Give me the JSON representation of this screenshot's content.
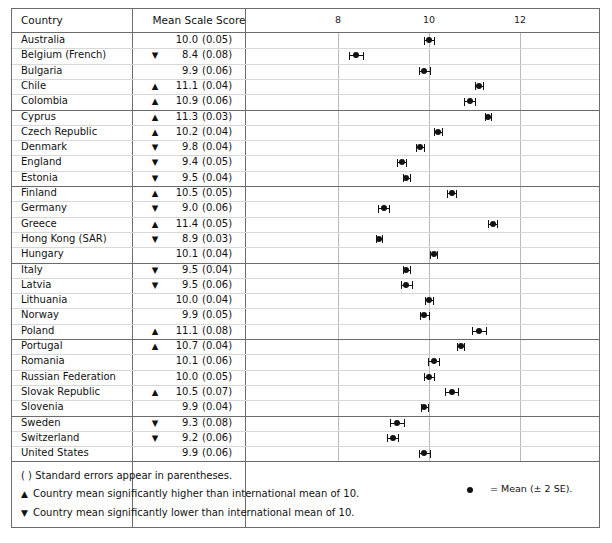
{
  "table": {
    "header": {
      "country_label": "Country",
      "score_label": "Mean Scale Score"
    }
  },
  "chart_data": {
    "type": "scatter",
    "title": "",
    "xlabel": "",
    "ylabel": "Country",
    "xlim": [
      6.9,
      13.2
    ],
    "ticks": [
      8,
      10,
      12
    ],
    "tick_labels": [
      "8",
      "10",
      "12"
    ],
    "grid": true,
    "error_bars": "±2 SE",
    "international_mean": 10,
    "categories": [
      "Australia",
      "Belgium (French)",
      "Bulgaria",
      "Chile",
      "Colombia",
      "Cyprus",
      "Czech Republic",
      "Denmark",
      "England",
      "Estonia",
      "Finland",
      "Germany",
      "Greece",
      "Hong Kong (SAR)",
      "Hungary",
      "Italy",
      "Latvia",
      "Lithuania",
      "Norway",
      "Poland",
      "Portugal",
      "Romania",
      "Russian Federation",
      "Slovak Republic",
      "Slovenia",
      "Sweden",
      "Switzerland",
      "United States"
    ],
    "values": [
      10.0,
      8.4,
      9.9,
      11.1,
      10.9,
      11.3,
      10.2,
      9.8,
      9.4,
      9.5,
      10.5,
      9.0,
      11.4,
      8.9,
      10.1,
      9.5,
      9.5,
      10.0,
      9.9,
      11.1,
      10.7,
      10.1,
      10.0,
      10.5,
      9.9,
      9.3,
      9.2,
      9.9
    ],
    "standard_errors": [
      0.05,
      0.08,
      0.06,
      0.04,
      0.06,
      0.03,
      0.04,
      0.04,
      0.05,
      0.04,
      0.05,
      0.06,
      0.05,
      0.03,
      0.04,
      0.04,
      0.06,
      0.04,
      0.05,
      0.08,
      0.04,
      0.06,
      0.05,
      0.07,
      0.04,
      0.08,
      0.06,
      0.06
    ],
    "significance": [
      "",
      "lower",
      "",
      "higher",
      "higher",
      "higher",
      "higher",
      "lower",
      "lower",
      "lower",
      "higher",
      "lower",
      "higher",
      "lower",
      "",
      "lower",
      "lower",
      "",
      "",
      "higher",
      "higher",
      "",
      "",
      "higher",
      "",
      "lower",
      "lower",
      ""
    ],
    "group_breaks": [
      5,
      10,
      15,
      20,
      25
    ]
  },
  "rows": [
    {
      "country": "Australia",
      "tri": "",
      "mean": "10.0",
      "se": "(0.05)"
    },
    {
      "country": "Belgium (French)",
      "tri": "▼",
      "mean": "8.4",
      "se": "(0.08)"
    },
    {
      "country": "Bulgaria",
      "tri": "",
      "mean": "9.9",
      "se": "(0.06)"
    },
    {
      "country": "Chile",
      "tri": "▲",
      "mean": "11.1",
      "se": "(0.04)"
    },
    {
      "country": "Colombia",
      "tri": "▲",
      "mean": "10.9",
      "se": "(0.06)"
    },
    {
      "country": "Cyprus",
      "tri": "▲",
      "mean": "11.3",
      "se": "(0.03)"
    },
    {
      "country": "Czech Republic",
      "tri": "▲",
      "mean": "10.2",
      "se": "(0.04)"
    },
    {
      "country": "Denmark",
      "tri": "▼",
      "mean": "9.8",
      "se": "(0.04)"
    },
    {
      "country": "England",
      "tri": "▼",
      "mean": "9.4",
      "se": "(0.05)"
    },
    {
      "country": "Estonia",
      "tri": "▼",
      "mean": "9.5",
      "se": "(0.04)"
    },
    {
      "country": "Finland",
      "tri": "▲",
      "mean": "10.5",
      "se": "(0.05)"
    },
    {
      "country": "Germany",
      "tri": "▼",
      "mean": "9.0",
      "se": "(0.06)"
    },
    {
      "country": "Greece",
      "tri": "▲",
      "mean": "11.4",
      "se": "(0.05)"
    },
    {
      "country": "Hong Kong (SAR)",
      "tri": "▼",
      "mean": "8.9",
      "se": "(0.03)"
    },
    {
      "country": "Hungary",
      "tri": "",
      "mean": "10.1",
      "se": "(0.04)"
    },
    {
      "country": "Italy",
      "tri": "▼",
      "mean": "9.5",
      "se": "(0.04)"
    },
    {
      "country": "Latvia",
      "tri": "▼",
      "mean": "9.5",
      "se": "(0.06)"
    },
    {
      "country": "Lithuania",
      "tri": "",
      "mean": "10.0",
      "se": "(0.04)"
    },
    {
      "country": "Norway",
      "tri": "",
      "mean": "9.9",
      "se": "(0.05)"
    },
    {
      "country": "Poland",
      "tri": "▲",
      "mean": "11.1",
      "se": "(0.08)"
    },
    {
      "country": "Portugal",
      "tri": "▲",
      "mean": "10.7",
      "se": "(0.04)"
    },
    {
      "country": "Romania",
      "tri": "",
      "mean": "10.1",
      "se": "(0.06)"
    },
    {
      "country": "Russian Federation",
      "tri": "",
      "mean": "10.0",
      "se": "(0.05)"
    },
    {
      "country": "Slovak Republic",
      "tri": "▲",
      "mean": "10.5",
      "se": "(0.07)"
    },
    {
      "country": "Slovenia",
      "tri": "",
      "mean": "9.9",
      "se": "(0.04)"
    },
    {
      "country": "Sweden",
      "tri": "▼",
      "mean": "9.3",
      "se": "(0.08)"
    },
    {
      "country": "Switzerland",
      "tri": "▼",
      "mean": "9.2",
      "se": "(0.06)"
    },
    {
      "country": "United States",
      "tri": "",
      "mean": "9.9",
      "se": "(0.06)"
    }
  ],
  "footer": {
    "note_se": "( ) Standard errors appear in parentheses.",
    "note_higher_sym": "▲",
    "note_higher": "Country mean significantly higher than international mean of 10.",
    "note_lower_sym": "▼",
    "note_lower": "Country mean significantly lower than international mean of 10.",
    "legend_text": "= Mean (± 2 SE)."
  }
}
